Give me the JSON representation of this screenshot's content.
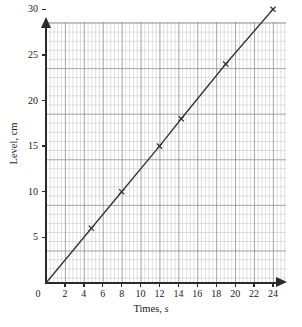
{
  "chart_data": {
    "type": "line",
    "title": "",
    "xlabel": "Times, s",
    "ylabel": "Level, cm",
    "xlim": [
      0,
      25.2
    ],
    "ylim": [
      0,
      33
    ],
    "grid": true,
    "legend": false,
    "x_ticks": [
      0,
      2,
      4,
      6,
      8,
      10,
      12,
      14,
      16,
      18,
      20,
      22,
      24
    ],
    "y_ticks": [
      5,
      10,
      15,
      20,
      25,
      30
    ],
    "origin_label": "0",
    "series": [
      {
        "name": "Level vs Time",
        "marker": "cross",
        "color": "#333333",
        "x": [
          0,
          4.8,
          8,
          12,
          14.3,
          19,
          24
        ],
        "y": [
          0,
          6,
          10,
          15,
          18,
          24,
          30
        ],
        "points": [
          {
            "x": 0,
            "y": 0,
            "marker": false
          },
          {
            "x": 4.8,
            "y": 6,
            "marker": true
          },
          {
            "x": 8,
            "y": 10,
            "marker": true
          },
          {
            "x": 12,
            "y": 15,
            "marker": true
          },
          {
            "x": 14.3,
            "y": 18,
            "marker": true
          },
          {
            "x": 19,
            "y": 24,
            "marker": true
          },
          {
            "x": 24,
            "y": 30,
            "marker": true
          }
        ]
      }
    ]
  },
  "axis": {
    "x_title_text": "Times,",
    "x_title_unit": "s",
    "y_title": "Level, cm"
  },
  "colors": {
    "line": "#333333",
    "axis": "#2a2a2a",
    "grid_major": "#78787f",
    "grid_minor": "#96969e",
    "background": "#ffffff",
    "text": "#1a1a1a"
  }
}
